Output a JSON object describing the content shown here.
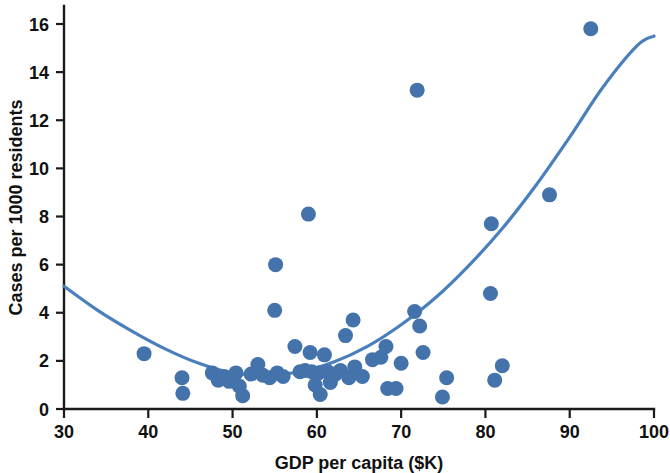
{
  "chart_data": {
    "type": "scatter",
    "title": "",
    "subtitle": "",
    "xlabel": "GDP per capita ($K)",
    "ylabel": "Cases per 1000 residents",
    "xlim": [
      30,
      100
    ],
    "ylim": [
      0,
      16.8
    ],
    "xticks": [
      30,
      40,
      50,
      60,
      70,
      80,
      90,
      100
    ],
    "xtick_labels": [
      "30",
      "40",
      "50",
      "60",
      "70",
      "80",
      "90",
      "100"
    ],
    "yticks": [
      0,
      2,
      4,
      6,
      8,
      10,
      12,
      14,
      16
    ],
    "ytick_labels": [
      "0",
      "2",
      "4",
      "6",
      "8",
      "10",
      "12",
      "14",
      "16"
    ],
    "grid": false,
    "legend": null,
    "marker_color": "#4472ab",
    "curve_color": "#4a7fbd",
    "axis_color": "#1a1a1a",
    "marker_radius_px": 7.5,
    "points": [
      {
        "x": 39.5,
        "y": 2.3
      },
      {
        "x": 44.0,
        "y": 1.3
      },
      {
        "x": 44.1,
        "y": 0.65
      },
      {
        "x": 47.6,
        "y": 1.5
      },
      {
        "x": 48.3,
        "y": 1.2
      },
      {
        "x": 49.0,
        "y": 1.35
      },
      {
        "x": 49.6,
        "y": 1.15
      },
      {
        "x": 50.4,
        "y": 1.5
      },
      {
        "x": 50.8,
        "y": 0.95
      },
      {
        "x": 51.2,
        "y": 0.55
      },
      {
        "x": 52.2,
        "y": 1.45
      },
      {
        "x": 53.0,
        "y": 1.85
      },
      {
        "x": 53.6,
        "y": 1.4
      },
      {
        "x": 54.4,
        "y": 1.3
      },
      {
        "x": 55.0,
        "y": 4.1
      },
      {
        "x": 55.1,
        "y": 6.0
      },
      {
        "x": 55.3,
        "y": 1.5
      },
      {
        "x": 56.0,
        "y": 1.35
      },
      {
        "x": 57.4,
        "y": 2.6
      },
      {
        "x": 58.0,
        "y": 1.55
      },
      {
        "x": 58.6,
        "y": 1.6
      },
      {
        "x": 59.0,
        "y": 8.1
      },
      {
        "x": 59.2,
        "y": 2.35
      },
      {
        "x": 59.4,
        "y": 1.55
      },
      {
        "x": 59.8,
        "y": 1.0
      },
      {
        "x": 60.2,
        "y": 1.5
      },
      {
        "x": 60.4,
        "y": 0.6
      },
      {
        "x": 60.9,
        "y": 2.25
      },
      {
        "x": 61.3,
        "y": 1.55
      },
      {
        "x": 61.6,
        "y": 1.1
      },
      {
        "x": 62.2,
        "y": 1.45
      },
      {
        "x": 62.8,
        "y": 1.6
      },
      {
        "x": 63.4,
        "y": 3.05
      },
      {
        "x": 63.8,
        "y": 1.3
      },
      {
        "x": 64.3,
        "y": 3.7
      },
      {
        "x": 64.5,
        "y": 1.75
      },
      {
        "x": 65.4,
        "y": 1.35
      },
      {
        "x": 66.6,
        "y": 2.05
      },
      {
        "x": 67.6,
        "y": 2.15
      },
      {
        "x": 68.2,
        "y": 2.6
      },
      {
        "x": 68.4,
        "y": 0.85
      },
      {
        "x": 69.4,
        "y": 0.85
      },
      {
        "x": 70.0,
        "y": 1.9
      },
      {
        "x": 71.6,
        "y": 4.05
      },
      {
        "x": 71.9,
        "y": 13.25
      },
      {
        "x": 72.2,
        "y": 3.45
      },
      {
        "x": 72.6,
        "y": 2.35
      },
      {
        "x": 74.9,
        "y": 0.5
      },
      {
        "x": 75.4,
        "y": 1.3
      },
      {
        "x": 80.6,
        "y": 4.8
      },
      {
        "x": 80.7,
        "y": 7.7
      },
      {
        "x": 81.1,
        "y": 1.2
      },
      {
        "x": 82.0,
        "y": 1.8
      },
      {
        "x": 87.6,
        "y": 8.9
      },
      {
        "x": 92.5,
        "y": 15.8
      }
    ],
    "fit_curve": {
      "description": "quadratic trend line",
      "x": [
        30,
        34,
        38,
        42,
        46,
        50,
        54,
        58,
        62,
        66,
        70,
        74,
        78,
        82,
        86,
        90,
        94,
        98,
        100
      ],
      "y": [
        5.1,
        4.1,
        3.25,
        2.5,
        1.9,
        1.5,
        1.42,
        1.55,
        1.95,
        2.6,
        3.5,
        4.6,
        5.95,
        7.5,
        9.3,
        11.3,
        13.4,
        15.1,
        15.5
      ]
    }
  }
}
